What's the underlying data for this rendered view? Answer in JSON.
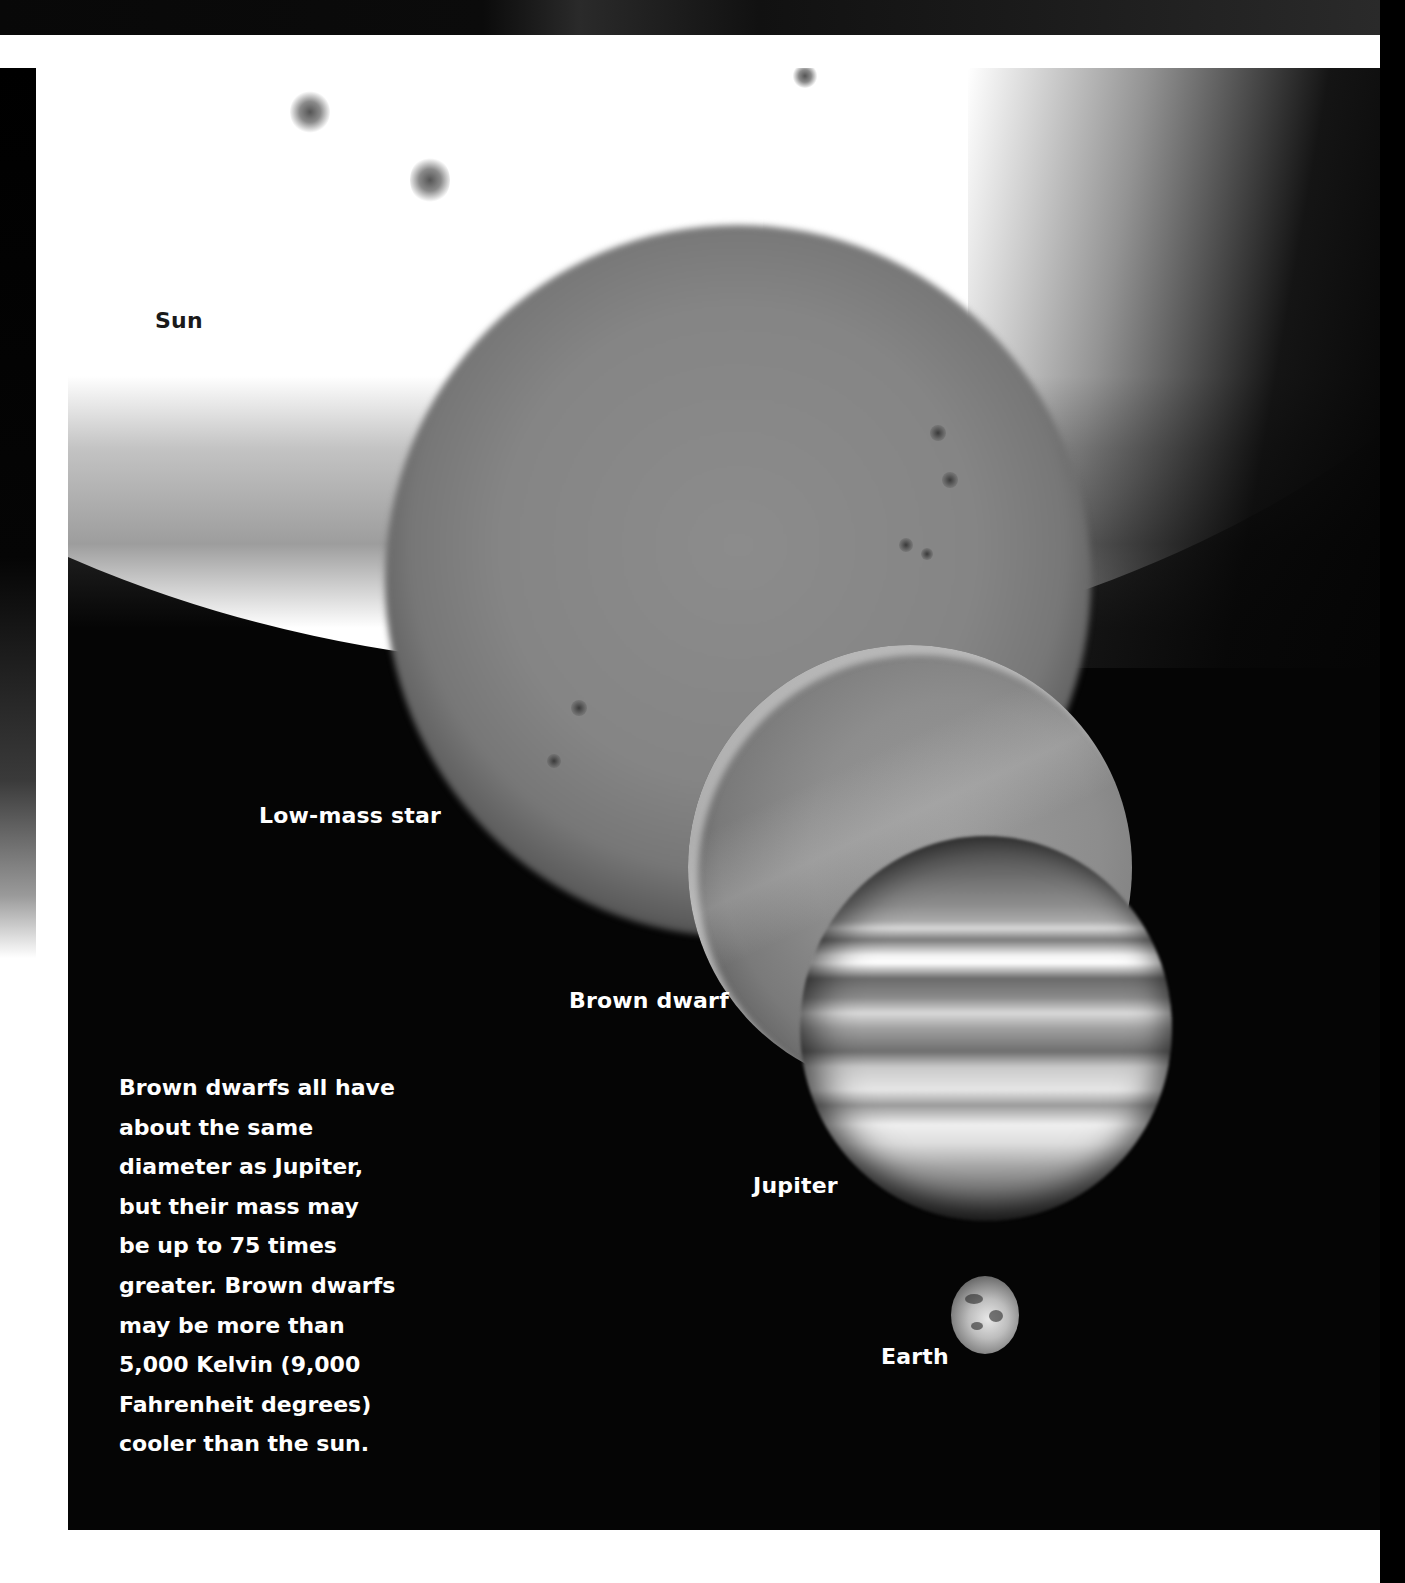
{
  "illustration": {
    "subject": "Size comparison of Sun, low-mass star, brown dwarf, Jupiter and Earth",
    "labels": {
      "sun": "Sun",
      "low_mass_star": "Low-mass star",
      "brown_dwarf": "Brown dwarf",
      "jupiter": "Jupiter",
      "earth": "Earth"
    },
    "caption_lines": [
      "Brown dwarfs all have",
      "about the same",
      "diameter as Jupiter,",
      "but their mass may",
      "be up to 75 times",
      "greater. Brown dwarfs",
      "may be more than",
      "5,000 Kelvin (9,000",
      "Fahrenheit degrees)",
      "cooler than the sun."
    ],
    "colors": {
      "background": "#050505",
      "sun_glow": "#ffffff",
      "label_on_dark": "#ffffff",
      "label_on_light": "#1a1a1a"
    }
  }
}
